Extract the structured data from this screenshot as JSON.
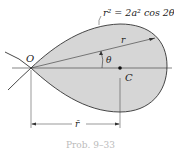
{
  "figure": {
    "equation": "r² = 2a² cos 2θ",
    "labels": {
      "origin": "O",
      "radius": "r",
      "angle": "θ",
      "centroid": "C",
      "rbar": "r̄"
    },
    "caption": "Prob. 9–33",
    "colors": {
      "fill": "#d6d6d6",
      "stroke": "#333333"
    }
  }
}
